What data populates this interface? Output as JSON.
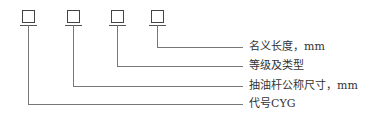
{
  "diagram": {
    "boxes": [
      {
        "id": "box-1",
        "x": 22,
        "y": 10
      },
      {
        "id": "box-2",
        "x": 67,
        "y": 10
      },
      {
        "id": "box-3",
        "x": 111,
        "y": 10
      },
      {
        "id": "box-4",
        "x": 151,
        "y": 10
      }
    ],
    "labels": [
      {
        "text": "名义长度，mm",
        "y": 47
      },
      {
        "text": "等级及类型",
        "y": 66
      },
      {
        "text": "抽油杆公称尺寸，mm",
        "y": 86
      },
      {
        "text": "代号CYG",
        "y": 104
      }
    ],
    "line_color": "#777777",
    "text_color": "#333333"
  }
}
